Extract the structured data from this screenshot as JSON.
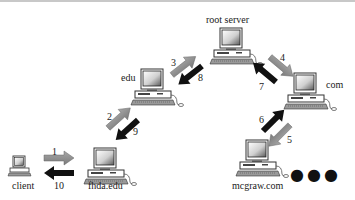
{
  "diagram": {
    "nodes": [
      {
        "id": "client",
        "label": "client"
      },
      {
        "id": "fhda",
        "label": "fhda.edu"
      },
      {
        "id": "edu",
        "label": "edu"
      },
      {
        "id": "root",
        "label": "root server"
      },
      {
        "id": "com",
        "label": "com"
      },
      {
        "id": "mcgraw",
        "label": "mcgraw.com"
      }
    ],
    "arrows": [
      {
        "step": "1",
        "from": "client",
        "to": "fhda",
        "type": "request",
        "color": "#8a8a8a"
      },
      {
        "step": "2",
        "from": "fhda",
        "to": "edu",
        "type": "request",
        "color": "#8a8a8a"
      },
      {
        "step": "3",
        "from": "edu",
        "to": "root",
        "type": "request",
        "color": "#8a8a8a"
      },
      {
        "step": "4",
        "from": "root",
        "to": "com",
        "type": "request",
        "color": "#8a8a8a"
      },
      {
        "step": "5",
        "from": "com",
        "to": "mcgraw",
        "type": "request",
        "color": "#8a8a8a"
      },
      {
        "step": "6",
        "from": "mcgraw",
        "to": "com",
        "type": "response",
        "color": "#111111"
      },
      {
        "step": "7",
        "from": "com",
        "to": "root",
        "type": "response",
        "color": "#111111"
      },
      {
        "step": "8",
        "from": "root",
        "to": "edu",
        "type": "response",
        "color": "#111111"
      },
      {
        "step": "9",
        "from": "edu",
        "to": "fhda",
        "type": "response",
        "color": "#111111"
      },
      {
        "step": "10",
        "from": "fhda",
        "to": "client",
        "type": "response",
        "color": "#111111"
      }
    ],
    "ellipsis": "●●●"
  }
}
